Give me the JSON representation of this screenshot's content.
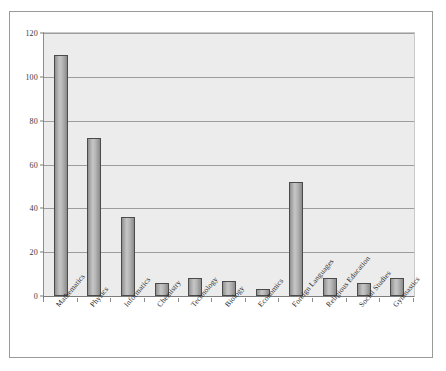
{
  "chart_data": {
    "type": "bar",
    "title": "",
    "subtitle": "",
    "xlabel": "",
    "ylabel": "",
    "ylim": [
      0,
      120
    ],
    "yticks": [
      0,
      20,
      40,
      60,
      80,
      100,
      120
    ],
    "grid": true,
    "legend": false,
    "legend_position": "none",
    "categories": [
      "Mathematics",
      "Physics",
      "Informatics",
      "Chemistry",
      "Technology",
      "Biology",
      "Economics",
      "Foreign Languages",
      "Religious Education",
      "Social Studies",
      "Gymnastics"
    ],
    "values": [
      110,
      72,
      36,
      6,
      8,
      7,
      3,
      52,
      8,
      6,
      8
    ],
    "series": [
      {
        "name": "",
        "values": [
          110,
          72,
          36,
          6,
          8,
          7,
          3,
          52,
          8,
          6,
          8
        ]
      }
    ],
    "colors": {
      "bar_fill": "#b6b6b6",
      "bar_edge": "#4b4b4b",
      "plot_background": "#ececec",
      "gridline": "#9d9d9d",
      "axis": "#6f6f6f",
      "frame": "#9a9a9a",
      "text": "#2e2e2e"
    }
  }
}
